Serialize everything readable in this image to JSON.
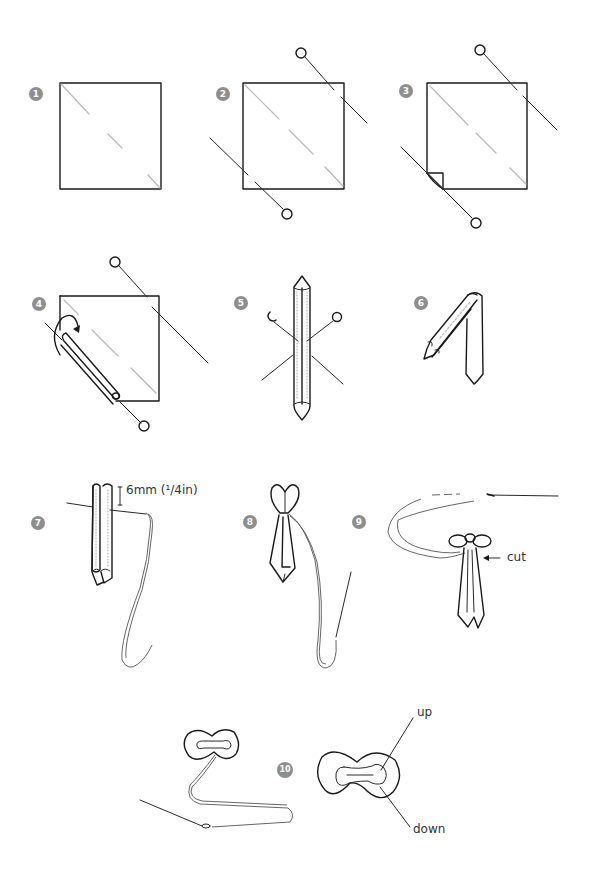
{
  "figure": {
    "type": "step-by-step craft instructions (folded ribbon bow/tie)",
    "badge_color": "#8e8e8e",
    "line_color": "#1a1a1a",
    "fold_line_color": "#b9b9b9"
  },
  "steps": [
    {
      "number": "1",
      "description": "Square of fabric with diagonal dashed fold line"
    },
    {
      "number": "2",
      "description": "Square with pins inserted along the diagonal"
    },
    {
      "number": "3",
      "description": "Square with pins, lower-left corner folded"
    },
    {
      "number": "4",
      "description": "Fabric rolled along diagonal with curved arrow"
    },
    {
      "number": "5",
      "description": "Rolled strip held with crossed pins"
    },
    {
      "number": "6",
      "description": "Strip folded into an inverted V"
    },
    {
      "number": "7",
      "description": "Folded strip with thread stitched near top",
      "annotation": "6mm (¹/4in)"
    },
    {
      "number": "8",
      "description": "Thread pulled to gather top into a bow"
    },
    {
      "number": "9",
      "description": "Thread wound around bow, excess to be cut",
      "annotation": "cut"
    },
    {
      "number": "10",
      "description": "Finished bow shape with thread",
      "annotations": [
        "up",
        "down"
      ]
    }
  ]
}
